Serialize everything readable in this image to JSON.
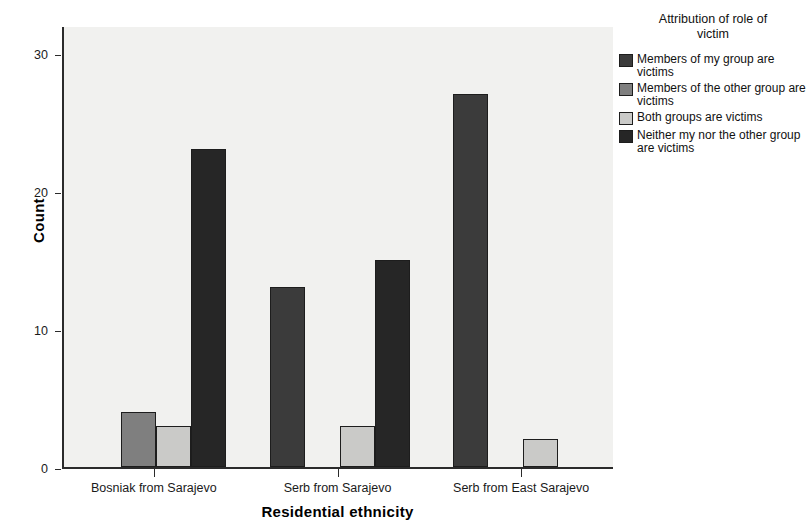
{
  "chart_data": {
    "type": "bar",
    "title": "",
    "xlabel": "Residential ethnicity",
    "ylabel": "Count",
    "ylim": [
      0,
      32
    ],
    "yticks": [
      0,
      10,
      20,
      30
    ],
    "ytick_labels": [
      "0",
      "10",
      "20",
      "30"
    ],
    "grid": false,
    "legend_position": "right",
    "legend_title": "Attribution of role of victim",
    "categories": [
      "Bosniak from Sarajevo",
      "Serb from Sarajevo",
      "Serb from East Sarajevo"
    ],
    "series": [
      {
        "name": "Members of my group are victims",
        "color": "#3b3b3b",
        "values": [
          null,
          13,
          27
        ]
      },
      {
        "name": "Members of the other group are victims",
        "color": "#7f7f7f",
        "values": [
          4,
          null,
          null
        ]
      },
      {
        "name": "Both groups are victims",
        "color": "#cacac8",
        "values": [
          3,
          3,
          2
        ]
      },
      {
        "name": "Neither my nor the other group are victims",
        "color": "#262626",
        "values": [
          23,
          15,
          null
        ]
      }
    ]
  },
  "axes": {
    "y_title": "Count",
    "x_title": "Residential ethnicity"
  },
  "legend": {
    "title_line_1": "Attribution of role of",
    "title_line_2": "victim",
    "items": [
      {
        "label": "Members of my group are victims",
        "color": "#3b3b3b"
      },
      {
        "label": "Members of the other group are victims",
        "color": "#7f7f7f"
      },
      {
        "label": "Both groups are victims",
        "color": "#cacac8"
      },
      {
        "label": "Neither my nor the other group are victims",
        "color": "#262626"
      }
    ]
  },
  "style": {
    "plot_background": "#f1f1ef",
    "axis_color": "#2b2b2b",
    "page_background": "#ffffff"
  }
}
